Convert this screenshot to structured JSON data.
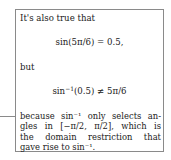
{
  "note": {
    "intro": "It's also true that",
    "equation1": "sin(5π/6) = 0.5,",
    "conjunction": "but",
    "equation2_fn": "sin",
    "equation2_sup": "−1",
    "equation2_rest": "(0.5) ≠ 5π/6",
    "explanation_lines": [
      "because sin⁻¹ only selects an-",
      "gles in [−π/2, π/2], which is",
      "the domain restriction that",
      "gave rise to sin⁻¹."
    ]
  },
  "colors": {
    "border": "#8a8a8a",
    "text": "#222222"
  }
}
